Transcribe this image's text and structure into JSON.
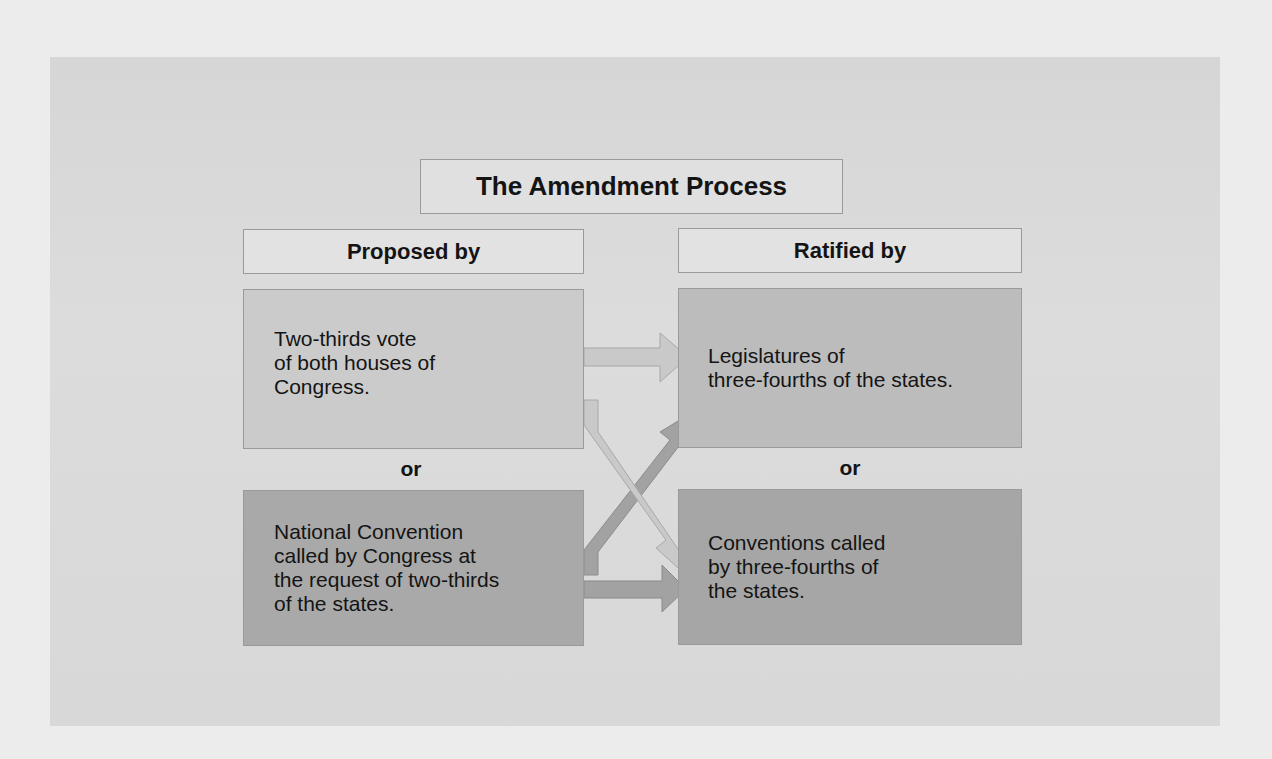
{
  "diagram": {
    "title": "The Amendment Process",
    "columns": {
      "proposed": {
        "header": "Proposed by"
      },
      "ratified": {
        "header": "Ratified by"
      }
    },
    "proposal_methods": [
      {
        "id": "congress",
        "text": "Two-thirds vote\nof both houses of\nCongress."
      },
      {
        "id": "national_convention",
        "text": "National Convention\ncalled by Congress at\nthe request of two-thirds\nof the  states."
      }
    ],
    "ratification_methods": [
      {
        "id": "legislatures",
        "text": "Legislatures of\nthree-fourths  of the states."
      },
      {
        "id": "conventions",
        "text": "Conventions called\nby three-fourths of\nthe states."
      }
    ],
    "separator_left": "or",
    "separator_right": "or",
    "connections": [
      {
        "from": "congress",
        "to": "legislatures"
      },
      {
        "from": "congress",
        "to": "conventions"
      },
      {
        "from": "national_convention",
        "to": "legislatures"
      },
      {
        "from": "national_convention",
        "to": "conventions"
      }
    ],
    "colors": {
      "page_background": "#ececec",
      "panel_background": "#d9d9d9",
      "light_box": "#cbcbcb",
      "dark_box": "#a9a9a9",
      "light_arrow": "#c6c6c6",
      "dark_arrow": "#a2a2a2"
    }
  }
}
